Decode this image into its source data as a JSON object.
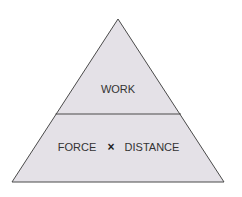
{
  "diagram": {
    "type": "formula-triangle",
    "top_section": {
      "label": "WORK"
    },
    "bottom_section": {
      "left_label": "FORCE",
      "operator": "×",
      "right_label": "DISTANCE"
    },
    "colors": {
      "fill": "#e4e1e7",
      "stroke": "#4a4a4a",
      "text": "#333333"
    }
  }
}
